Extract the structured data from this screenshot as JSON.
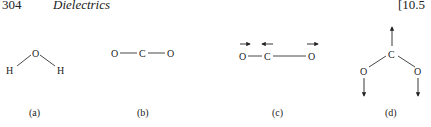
{
  "header": {
    "page_number": "304",
    "chapter_title": "Dielectrics",
    "section": "[10.5"
  },
  "figures": [
    {
      "id": "a",
      "caption": "(a)",
      "atoms": [
        "O",
        "H",
        "H"
      ],
      "description": "bent H2O molecule"
    },
    {
      "id": "b",
      "caption": "(b)",
      "atoms": [
        "O",
        "C",
        "O"
      ],
      "description": "linear CO2 molecule"
    },
    {
      "id": "c",
      "caption": "(c)",
      "atoms": [
        "O",
        "C",
        "O"
      ],
      "description": "CO2 asymmetric stretch with displacement arrows"
    },
    {
      "id": "d",
      "caption": "(d)",
      "atoms": [
        "C",
        "O",
        "O"
      ],
      "description": "CO2 bending mode with displacement arrows"
    }
  ]
}
